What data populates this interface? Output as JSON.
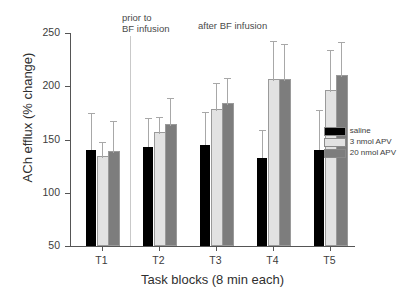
{
  "chart_data": {
    "type": "bar",
    "title": "",
    "xlabel": "Task blocks (8 min each)",
    "ylabel": "ACh efflux (% change)",
    "categories": [
      "T1",
      "T2",
      "T3",
      "T4",
      "T5"
    ],
    "ylim": [
      50,
      250
    ],
    "yticks": [
      50,
      100,
      150,
      200,
      250
    ],
    "grid": false,
    "legend_position": "right",
    "series": [
      {
        "name": "saline",
        "color": "#000000",
        "values": [
          140,
          143,
          145,
          133,
          140
        ],
        "errors": [
          34,
          26,
          30,
          25,
          37
        ]
      },
      {
        "name": "3 nmol APV",
        "color": "#e2e2e2",
        "values": [
          133,
          155,
          177,
          205,
          195
        ],
        "errors": [
          14,
          15,
          25,
          37,
          38
        ]
      },
      {
        "name": "20 nmol APV",
        "color": "#7d7d7d",
        "values": [
          137,
          163,
          182,
          205,
          209
        ],
        "errors": [
          29,
          25,
          25,
          34,
          32
        ]
      }
    ],
    "annotations": [
      {
        "text": "prior to\nBF infusion",
        "x_category": "T1"
      },
      {
        "text": "after BF infusion",
        "x_category": "T2"
      }
    ],
    "divider": {
      "after_category": "T1",
      "color": "#c9c9c9"
    }
  },
  "axes": {
    "y_tick_labels": [
      "250",
      "200",
      "150",
      "100",
      "50"
    ],
    "x_tick_labels": [
      "T1",
      "T2",
      "T3",
      "T4",
      "T5"
    ],
    "y_title": "ACh efflux (% change)",
    "x_title": "Task blocks (8 min each)"
  },
  "annotations": {
    "prior": "prior to\nBF infusion",
    "after": "after BF infusion"
  },
  "legend": {
    "items": [
      {
        "label": "saline",
        "color": "#000000"
      },
      {
        "label": "3 nmol APV",
        "color": "#e2e2e2"
      },
      {
        "label": "20 nmol APV",
        "color": "#7d7d7d"
      }
    ]
  }
}
